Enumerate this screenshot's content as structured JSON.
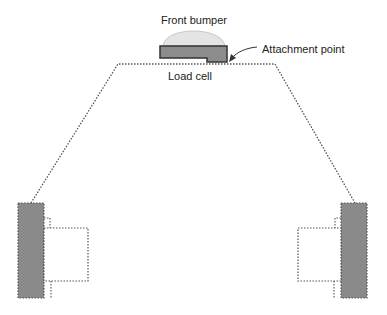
{
  "labels": {
    "front_bumper": "Front bumper",
    "attachment_point": "Attachment point",
    "load_cell": "Load cell"
  },
  "colors": {
    "bumper_fill": "#e4e4e4",
    "bumper_stroke": "#c8c8c8",
    "load_cell_fill": "#8c8c8c",
    "load_cell_stroke": "#333333",
    "wheel_fill": "#8a8a8a",
    "outline": "#555555",
    "text": "#222222"
  }
}
